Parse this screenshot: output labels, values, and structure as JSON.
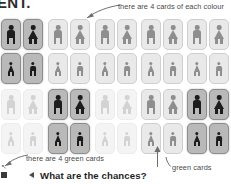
{
  "header": {
    "text": "ENT."
  },
  "grid": {
    "columns": 10,
    "rows": 4,
    "column_pairs": 5,
    "cells": [
      [
        {
          "type": "male",
          "state": "highlight"
        },
        {
          "type": "female",
          "state": "highlight"
        },
        {
          "type": "male",
          "state": "normal"
        },
        {
          "type": "female",
          "state": "normal"
        },
        {
          "type": "male",
          "state": "normal"
        },
        {
          "type": "female",
          "state": "normal"
        },
        {
          "type": "male",
          "state": "normal"
        },
        {
          "type": "female",
          "state": "normal"
        },
        {
          "type": "male",
          "state": "normal"
        },
        {
          "type": "female",
          "state": "normal"
        }
      ],
      [
        {
          "type": "female",
          "state": "highlight"
        },
        {
          "type": "male",
          "state": "highlight"
        },
        {
          "type": "female",
          "state": "normal"
        },
        {
          "type": "male",
          "state": "normal"
        },
        {
          "type": "female",
          "state": "normal"
        },
        {
          "type": "male",
          "state": "normal"
        },
        {
          "type": "female",
          "state": "normal"
        },
        {
          "type": "male",
          "state": "normal"
        },
        {
          "type": "female",
          "state": "normal"
        },
        {
          "type": "male",
          "state": "normal"
        }
      ],
      [
        {
          "type": "male",
          "state": "faded"
        },
        {
          "type": "female",
          "state": "faded"
        },
        {
          "type": "male",
          "state": "highlight"
        },
        {
          "type": "female",
          "state": "highlight"
        },
        {
          "type": "male",
          "state": "faded"
        },
        {
          "type": "female",
          "state": "faded"
        },
        {
          "type": "male",
          "state": "normal"
        },
        {
          "type": "female",
          "state": "normal"
        },
        {
          "type": "male",
          "state": "highlight"
        },
        {
          "type": "female",
          "state": "highlight"
        }
      ],
      [
        {
          "type": "female",
          "state": "faded"
        },
        {
          "type": "male",
          "state": "faded"
        },
        {
          "type": "female",
          "state": "highlight"
        },
        {
          "type": "male",
          "state": "highlight"
        },
        {
          "type": "female",
          "state": "faded"
        },
        {
          "type": "male",
          "state": "faded"
        },
        {
          "type": "female",
          "state": "normal"
        },
        {
          "type": "male",
          "state": "normal"
        },
        {
          "type": "female",
          "state": "highlight"
        },
        {
          "type": "male",
          "state": "highlight"
        }
      ]
    ]
  },
  "annotations": {
    "top_right": {
      "text": "there are 4 cards of each colour"
    },
    "bottom_left": {
      "text": "there are 4 green cards"
    },
    "bottom_right": {
      "text": "green cards"
    }
  },
  "footer": {
    "heading": "What are the chances?"
  },
  "colors": {
    "card_normal_bg": "#e9e9e9",
    "card_highlight_bg": "#b9b9b9",
    "card_faded_bg": "#f4f4f4",
    "figure_dark": "#1c1c1c",
    "figure_mid": "#8e8e8e",
    "figure_light": "#d3d3d3",
    "annotation_text": "#4a4a4a",
    "heading_text": "#1f1f1f"
  }
}
